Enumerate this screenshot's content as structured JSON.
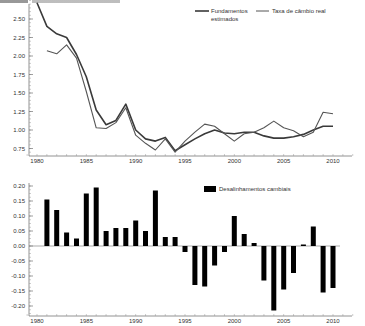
{
  "header": {
    "partial_title": ""
  },
  "chart_data": [
    {
      "type": "line",
      "title": "",
      "xlabel": "",
      "ylabel": "",
      "x": [
        1980,
        1981,
        1982,
        1983,
        1984,
        1985,
        1986,
        1987,
        1988,
        1989,
        1990,
        1991,
        1992,
        1993,
        1994,
        1995,
        1996,
        1997,
        1998,
        1999,
        2000,
        2001,
        2002,
        2003,
        2004,
        2005,
        2006,
        2007,
        2008,
        2009,
        2010
      ],
      "series": [
        {
          "name": "Fundamentos estimados",
          "legend_line1": "Fundamentos",
          "legend_line2": "estimados",
          "stroke": "#3a3a3a",
          "width": 1.6,
          "values": [
            2.72,
            2.4,
            2.3,
            2.25,
            2.02,
            1.72,
            1.27,
            1.07,
            1.13,
            1.35,
            1.0,
            0.88,
            0.85,
            0.9,
            0.72,
            0.8,
            0.88,
            0.95,
            1.0,
            0.96,
            0.95,
            0.97,
            0.97,
            0.92,
            0.89,
            0.89,
            0.91,
            0.94,
            1.0,
            1.05,
            1.05
          ]
        },
        {
          "name": "Taxa de câmbio real",
          "stroke": "#555555",
          "width": 1.1,
          "values": [
            null,
            2.07,
            2.03,
            2.15,
            1.97,
            1.52,
            1.03,
            1.02,
            1.1,
            1.3,
            0.93,
            0.82,
            0.73,
            0.88,
            0.7,
            0.85,
            0.97,
            1.08,
            1.05,
            0.95,
            0.85,
            0.95,
            0.97,
            1.03,
            1.12,
            1.03,
            0.99,
            0.91,
            0.97,
            1.24,
            1.22
          ]
        }
      ],
      "yticks": [
        "2.50",
        "2.25",
        "2.00",
        "1.75",
        "1.50",
        "1.25",
        "1.00",
        "0.75"
      ],
      "ytick_values": [
        2.5,
        2.25,
        2.0,
        1.75,
        1.5,
        1.25,
        1.0,
        0.75
      ],
      "xticks": [
        "1980",
        "1985",
        "1990",
        "1995",
        "2000",
        "2005",
        "2010"
      ],
      "xtick_values": [
        1980,
        1985,
        1990,
        1995,
        2000,
        2005,
        2010
      ],
      "ylim": [
        0.68,
        2.78
      ],
      "xlim": [
        1979,
        2012
      ],
      "grid": false,
      "legend_position": "top-right"
    },
    {
      "type": "bar",
      "title": "",
      "xlabel": "",
      "ylabel": "",
      "categories": [
        1981,
        1982,
        1983,
        1984,
        1985,
        1986,
        1987,
        1988,
        1989,
        1990,
        1991,
        1992,
        1993,
        1994,
        1995,
        1996,
        1997,
        1998,
        1999,
        2000,
        2001,
        2002,
        2003,
        2004,
        2005,
        2006,
        2007,
        2008,
        2009,
        2010
      ],
      "series": [
        {
          "name": "Desalinhamentos cambiais",
          "color": "#000000",
          "values": [
            0.155,
            0.12,
            0.045,
            0.025,
            0.175,
            0.195,
            0.05,
            0.06,
            0.06,
            0.085,
            0.05,
            0.185,
            0.03,
            0.03,
            -0.02,
            -0.13,
            -0.135,
            -0.065,
            -0.02,
            0.1,
            0.04,
            0.01,
            -0.115,
            -0.215,
            -0.145,
            -0.09,
            0.005,
            0.065,
            -0.155,
            -0.14
          ]
        }
      ],
      "yticks": [
        "0.20",
        "0.15",
        "0.10",
        "0.05",
        "0.00",
        "-0.05",
        "-0.10",
        "-0.15",
        "-0.20"
      ],
      "ytick_values": [
        0.2,
        0.15,
        0.1,
        0.05,
        0.0,
        -0.05,
        -0.1,
        -0.15,
        -0.2
      ],
      "xticks": [
        "1980",
        "1985",
        "1990",
        "1995",
        "2000",
        "2005",
        "2010"
      ],
      "xtick_values": [
        1980,
        1985,
        1990,
        1995,
        2000,
        2005,
        2010
      ],
      "ylim": [
        -0.23,
        0.21
      ],
      "xlim": [
        1979,
        2012
      ],
      "grid": false,
      "legend_position": "top-right"
    }
  ]
}
